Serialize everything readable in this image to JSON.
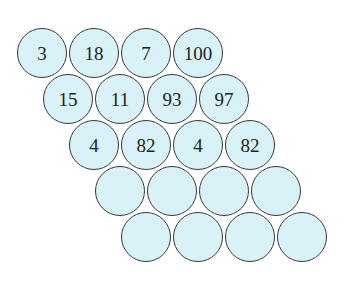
{
  "diagram": {
    "colors": {
      "fill": "#d8f2f7",
      "stroke": "#3a3a3a",
      "text": "#222222"
    },
    "layout": {
      "origin_x": 42,
      "origin_y": 53,
      "col_step": 52,
      "row_shift_x": 26,
      "row_step_y": 46,
      "diameter": 52
    },
    "rows": [
      [
        "3",
        "18",
        "7",
        "100"
      ],
      [
        "15",
        "11",
        "93",
        "97"
      ],
      [
        "4",
        "82",
        "4",
        "82"
      ],
      [
        "",
        "",
        "",
        ""
      ],
      [
        "",
        "",
        "",
        ""
      ]
    ]
  }
}
